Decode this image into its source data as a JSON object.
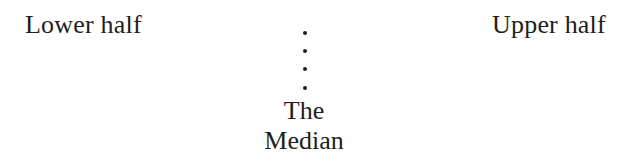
{
  "diagram": {
    "left_label": "Lower half",
    "right_label": "Upper half",
    "center": {
      "line1": "The",
      "line2": "Median",
      "divider": {
        "style": "dotted-vertical",
        "dot_count": 4,
        "x": 305,
        "dot_y": [
          33,
          51,
          69,
          88
        ]
      }
    }
  },
  "colors": {
    "text": "#1e1e1e",
    "background": "#ffffff"
  }
}
